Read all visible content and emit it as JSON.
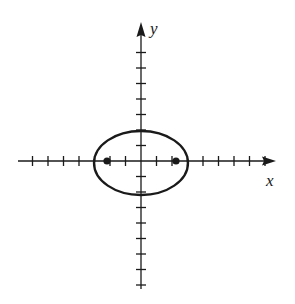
{
  "diagram": {
    "type": "ellipse-with-foci",
    "axes": {
      "x_label": "x",
      "y_label": "y",
      "origin_px": [
        141,
        161
      ],
      "tick_spacing_px": 15.5,
      "x_ticks": [
        -7,
        -6,
        -5,
        -4,
        -3,
        -2,
        -1,
        1,
        2,
        3,
        4,
        5,
        6,
        7,
        8
      ],
      "y_ticks": [
        -8,
        -7,
        -6,
        -5,
        -4,
        -3,
        -2,
        -1,
        1,
        2,
        3,
        4,
        5,
        6,
        7
      ]
    },
    "ellipse": {
      "center": [
        0,
        0
      ],
      "semi_major_x_units": 3,
      "semi_minor_y_units": 2
    },
    "foci": [
      {
        "label": "left-focus",
        "x_units": -2.2,
        "y_units": 0
      },
      {
        "label": "right-focus",
        "x_units": 2.2,
        "y_units": 0
      }
    ],
    "colors": {
      "stroke": "#1a1a1a",
      "background": "#ffffff"
    }
  }
}
